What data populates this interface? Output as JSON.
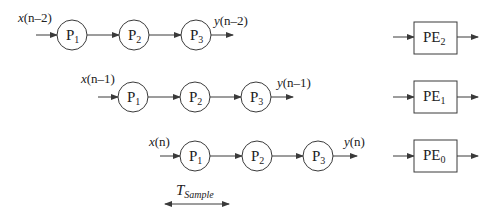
{
  "diagram": {
    "type": "pipeline-timing",
    "colors": {
      "stroke": "#3a3a3a",
      "text": "#222222",
      "background": "#ffffff"
    },
    "rows": [
      {
        "input_label": {
          "var": "x",
          "arg": "(n–2)"
        },
        "output_label": {
          "var": "y",
          "arg": "(n–2)"
        },
        "nodes": [
          {
            "base": "P",
            "sub": "1"
          },
          {
            "base": "P",
            "sub": "2"
          },
          {
            "base": "P",
            "sub": "3"
          }
        ],
        "processing_element": {
          "base": "PE",
          "sub": "2"
        }
      },
      {
        "input_label": {
          "var": "x",
          "arg": "(n–1)"
        },
        "output_label": {
          "var": "y",
          "arg": "(n–1)"
        },
        "nodes": [
          {
            "base": "P",
            "sub": "1"
          },
          {
            "base": "P",
            "sub": "2"
          },
          {
            "base": "P",
            "sub": "3"
          }
        ],
        "processing_element": {
          "base": "PE",
          "sub": "1"
        }
      },
      {
        "input_label": {
          "var": "x",
          "arg": "(n)"
        },
        "output_label": {
          "var": "y",
          "arg": "(n)"
        },
        "nodes": [
          {
            "base": "P",
            "sub": "1"
          },
          {
            "base": "P",
            "sub": "2"
          },
          {
            "base": "P",
            "sub": "3"
          }
        ],
        "processing_element": {
          "base": "PE",
          "sub": "0"
        }
      }
    ],
    "time_span": {
      "base": "T",
      "sub": "Sample"
    }
  }
}
